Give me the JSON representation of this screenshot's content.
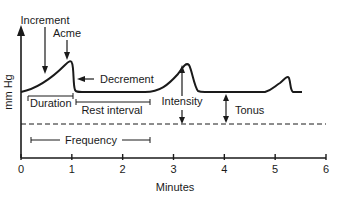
{
  "diagram": {
    "type": "uterine-contraction-diagram",
    "y_axis_label": "mm Hg",
    "x_axis_label": "Minutes",
    "x_ticks": [
      "0",
      "1",
      "2",
      "3",
      "4",
      "5",
      "6"
    ],
    "x_range": [
      0,
      6
    ],
    "labels": {
      "increment": "Increment",
      "acme": "Acme",
      "decrement": "Decrement",
      "duration": "Duration",
      "rest_interval": "Rest interval",
      "intensity": "Intensity",
      "tonus": "Tonus",
      "frequency": "Frequency"
    },
    "contractions": [
      {
        "start_min": 0.0,
        "peak_min": 0.95,
        "end_min": 1.1
      },
      {
        "start_min": 2.45,
        "peak_min": 3.05,
        "end_min": 3.5
      },
      {
        "start_min": 4.9,
        "peak_min": 5.55,
        "end_min": 5.75
      }
    ],
    "spans": {
      "duration": [
        0.05,
        0.95
      ],
      "rest_interval": [
        1.05,
        2.55
      ],
      "frequency": [
        0.2,
        2.55
      ]
    },
    "colors": {
      "ink": "#1a1a1a",
      "background": "#ffffff"
    }
  }
}
